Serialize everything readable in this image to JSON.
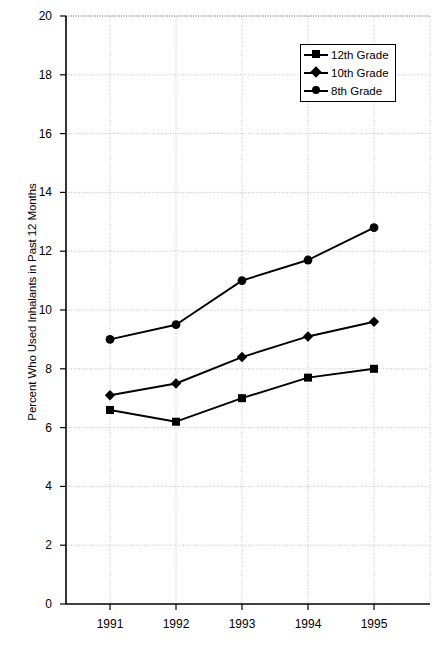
{
  "chart_data": {
    "type": "line",
    "title": "",
    "xlabel": "",
    "ylabel": "Percent Who Used Inhalants in Past 12 Months",
    "categories": [
      "1991",
      "1992",
      "1993",
      "1994",
      "1995"
    ],
    "x": [
      1991,
      1992,
      1993,
      1994,
      1995
    ],
    "xlim": [
      1990.5,
      1995.9
    ],
    "ylim": [
      0,
      20
    ],
    "ytick_step": 2,
    "yticks": [
      "0",
      "2",
      "4",
      "6",
      "8",
      "10",
      "12",
      "14",
      "16",
      "18",
      "20"
    ],
    "grid": true,
    "legend_position": "top-right",
    "series": [
      {
        "name": "12th Grade",
        "marker": "square",
        "color": "#000000",
        "values": [
          6.6,
          6.2,
          7.0,
          7.7,
          8.0
        ]
      },
      {
        "name": "10th Grade",
        "marker": "diamond",
        "color": "#000000",
        "values": [
          7.1,
          7.5,
          8.4,
          9.1,
          9.6
        ]
      },
      {
        "name": "8th Grade",
        "marker": "circle",
        "color": "#000000",
        "values": [
          9.0,
          9.5,
          11.0,
          11.7,
          12.8
        ]
      }
    ]
  },
  "legend": {
    "items": [
      {
        "label": "12th Grade",
        "marker": "square"
      },
      {
        "label": "10th Grade",
        "marker": "diamond"
      },
      {
        "label": "8th Grade",
        "marker": "circle"
      }
    ]
  },
  "axis": {
    "y_title": "Percent Who Used Inhalants in Past 12 Months",
    "y_ticks": [
      "20",
      "18",
      "16",
      "14",
      "12",
      "10",
      "8",
      "6",
      "4",
      "2",
      "0"
    ],
    "x_ticks": [
      "1991",
      "1992",
      "1993",
      "1994",
      "1995"
    ]
  },
  "caption": {
    "text": ""
  },
  "colors": {
    "ink": "#000000",
    "grid": "#b8b8b8",
    "axis": "#000000",
    "background": "#ffffff"
  }
}
